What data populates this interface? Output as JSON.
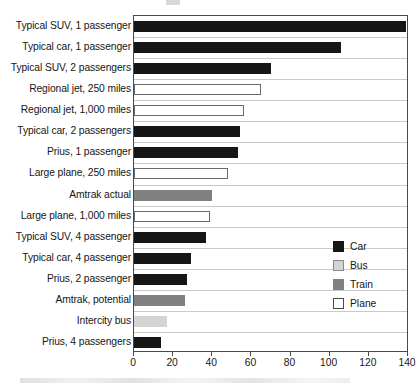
{
  "chart_data": {
    "type": "bar",
    "orientation": "horizontal",
    "title": "",
    "xlabel": "",
    "ylabel": "",
    "xlim": [
      0,
      140
    ],
    "xticks": [
      0,
      20,
      40,
      60,
      80,
      100,
      120,
      140
    ],
    "grid": true,
    "legend_position": "middle-right",
    "categories": [
      "Typical SUV, 1 passenger",
      "Typical car, 1 passenger",
      "Typical SUV, 2 passengers",
      "Regional jet, 250 miles",
      "Regional jet, 1,000 miles",
      "Typical car, 2 passengers",
      "Prius, 1 passenger",
      "Large plane, 250 miles",
      "Amtrak actual",
      "Large plane, 1,000 miles",
      "Typical SUV, 4 passenger",
      "Typical car, 4 passenger",
      "Prius, 2 passenger",
      "Amtrak, potential",
      "Intercity bus",
      "Prius, 4 passengers"
    ],
    "values": [
      139,
      106,
      70,
      65,
      56,
      54,
      53,
      48,
      40,
      39,
      37,
      29,
      27,
      26,
      17,
      14
    ],
    "groups": [
      "Car",
      "Car",
      "Car",
      "Plane",
      "Plane",
      "Car",
      "Car",
      "Plane",
      "Train",
      "Plane",
      "Car",
      "Car",
      "Car",
      "Train",
      "Bus",
      "Car"
    ],
    "legend": [
      {
        "label": "Car",
        "key": "car",
        "color": "#161616"
      },
      {
        "label": "Bus",
        "key": "bus",
        "color": "#d4d4d4"
      },
      {
        "label": "Train",
        "key": "train",
        "color": "#808080"
      },
      {
        "label": "Plane",
        "key": "plane",
        "color": "#ffffff"
      }
    ]
  }
}
